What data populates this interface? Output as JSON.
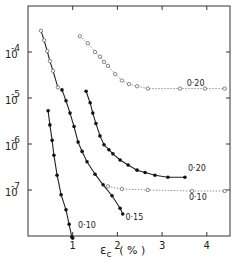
{
  "chart_data": {
    "type": "line",
    "title": "",
    "xlabel": "ε_c ( % )",
    "ylabel": "",
    "xlim": [
      0,
      4.5
    ],
    "ylim": [
      1e-08,
      0.0003
    ],
    "yscale": "log",
    "grid": false,
    "legend": "inline curve labels",
    "x_ticks": [
      "1",
      "2",
      "3",
      "4"
    ],
    "y_ticks": [
      "10^-4",
      "10^-5",
      "10^-6",
      "10^-7"
    ],
    "series": [
      {
        "name": "open-steep",
        "label": "",
        "marker": "open-circle",
        "line": "solid",
        "x": [
          0.29,
          0.36,
          0.43,
          0.49,
          0.56,
          0.67
        ],
        "y": [
          0.00029,
          0.00018,
          0.000105,
          6.3e-05,
          3.9e-05,
          1.7e-05
        ]
      },
      {
        "name": "open-0.20",
        "label": "0·20",
        "marker": "open-circle",
        "line": "dotted",
        "x": [
          1.16,
          1.34,
          1.5,
          1.61,
          1.7,
          1.79,
          1.95,
          2.1,
          2.26,
          2.44,
          2.68,
          3.4,
          3.96,
          4.4
        ],
        "y": [
          0.00022,
          0.000155,
          0.0001,
          7.9e-05,
          6.1e-05,
          5e-05,
          3.3e-05,
          2.4e-05,
          2e-05,
          1.8e-05,
          1.6e-05,
          1.6e-05,
          1.6e-05,
          1.6e-05
        ]
      },
      {
        "name": "filled-0.20",
        "label": "0·20",
        "marker": "filled-circle",
        "line": "solid",
        "x": [
          1.3,
          1.39,
          1.45,
          1.52,
          1.61,
          1.7,
          1.81,
          1.9,
          2.06,
          2.24,
          2.44,
          2.62,
          2.84,
          3.13,
          3.51
        ],
        "y": [
          1.4e-05,
          7.9e-06,
          4.7e-06,
          2.8e-06,
          1.5e-06,
          9.6e-07,
          7.5e-07,
          6.1e-07,
          4.5e-07,
          3.5e-07,
          2.7e-07,
          2.4e-07,
          2.1e-07,
          1.9e-07,
          1.9e-07
        ]
      },
      {
        "name": "filled-0.10",
        "label": "0·10",
        "marker": "filled-circle",
        "line": "solid",
        "x": [
          0.45,
          0.49,
          0.54,
          0.58,
          0.65,
          0.74,
          0.85,
          0.92,
          0.98,
          1.0
        ],
        "y": [
          5.3e-06,
          2.6e-06,
          1.2e-06,
          5.7e-07,
          2.1e-07,
          7.9e-08,
          3.7e-08,
          1.8e-08,
          9.5e-09,
          9e-09
        ]
      },
      {
        "name": "filled-0.15",
        "label": "0·15",
        "marker": "filled-circle",
        "line": "solid",
        "x": [
          0.76,
          0.85,
          0.94,
          1.03,
          1.12,
          1.21,
          1.32,
          1.5,
          1.68,
          1.88,
          2.06,
          2.12
        ],
        "y": [
          1.5e-05,
          8.7e-06,
          4.7e-06,
          2.4e-06,
          1.1e-06,
          6.9e-07,
          4.1e-07,
          2.2e-07,
          1.3e-07,
          7.5e-08,
          4e-08,
          3e-08
        ]
      },
      {
        "name": "open-0.10",
        "label": "0·10",
        "marker": "open-circle",
        "line": "dotted",
        "x": [
          1.79,
          2.1,
          2.68,
          3.67,
          4.4
        ],
        "y": [
          1.2e-07,
          1.05e-07,
          1e-07,
          9.5e-08,
          9.5e-08
        ]
      }
    ],
    "annotations": [
      {
        "text": "0·20",
        "x": 3.55,
        "y": 1.8e-05
      },
      {
        "text": "0·20",
        "x": 3.58,
        "y": 2.6e-07
      },
      {
        "text": "0·10",
        "x": 3.6,
        "y": 6e-08
      },
      {
        "text": "0·15",
        "x": 2.18,
        "y": 2.2e-08
      },
      {
        "text": "0·10",
        "x": 1.12,
        "y": 1.5e-08
      }
    ]
  },
  "axes": {
    "x_label_main": "ε",
    "x_label_sub": "c",
    "x_label_unit": "( % )",
    "y_tick_base": "10",
    "y_tick_exps": [
      "-4",
      "-5",
      "-6",
      "-7"
    ]
  }
}
